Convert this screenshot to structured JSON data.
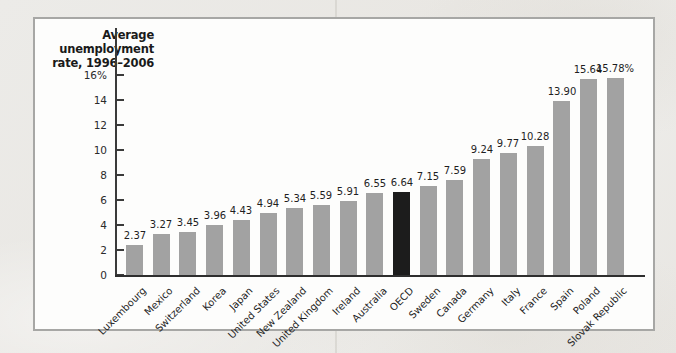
{
  "page": {
    "background_color": "#eae8e4",
    "panel_background": "#fdfdfc",
    "panel_border_color": "#a7a7a5"
  },
  "chart_data": {
    "type": "bar",
    "title": "Average unemployment rate, 1996–2006",
    "title_lines": [
      "Average",
      "unemployment",
      "rate, 1996–2006"
    ],
    "categories": [
      "Luxembourg",
      "Mexico",
      "Switzerland",
      "Korea",
      "Japan",
      "United States",
      "New Zealand",
      "United Kingdom",
      "Ireland",
      "Australia",
      "OECD",
      "Sweden",
      "Canada",
      "Germany",
      "Italy",
      "France",
      "Spain",
      "Poland",
      "Slovak Republic"
    ],
    "values": [
      2.37,
      3.27,
      3.45,
      3.96,
      4.43,
      4.94,
      5.34,
      5.59,
      5.91,
      6.55,
      6.64,
      7.15,
      7.59,
      9.24,
      9.77,
      10.28,
      13.9,
      15.64,
      15.78
    ],
    "value_labels": [
      "2.37",
      "3.27",
      "3.45",
      "3.96",
      "4.43",
      "4.94",
      "5.34",
      "5.59",
      "5.91",
      "6.55",
      "6.64",
      "7.15",
      "7.59",
      "9.24",
      "9.77",
      "10.28",
      "13.90",
      "15.64",
      "15.78%"
    ],
    "highlight_category": "OECD",
    "highlight_index": 10,
    "y_ticks": [
      0,
      2,
      4,
      6,
      8,
      10,
      12,
      14,
      16
    ],
    "y_tick_labels": [
      "0",
      "2",
      "4",
      "6",
      "8",
      "10",
      "12",
      "14",
      "16%"
    ],
    "ylim": [
      0,
      16
    ],
    "xlabel": "",
    "ylabel": "Average unemployment rate, 1996–2006",
    "grid": false,
    "legend": null,
    "bar_color": "#a2a2a2",
    "highlight_color": "#1c1c1c",
    "axis_color": "#3a3a3a"
  }
}
